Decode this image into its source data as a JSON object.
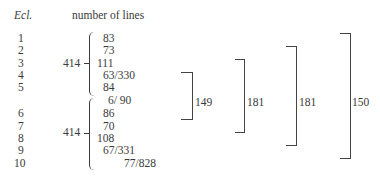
{
  "header": {
    "ecl_label": "Ecl.",
    "lines_label": "number of lines"
  },
  "eclogues": [
    "1",
    "2",
    "3",
    "4",
    "5",
    "6",
    "7",
    "8",
    "9",
    "10"
  ],
  "group1": {
    "total": "414",
    "values": [
      "83",
      "73",
      "111",
      "63/330",
      "84"
    ]
  },
  "group2": {
    "total": "414",
    "values": [
      "6/ 90",
      "86",
      "70",
      "108",
      "67/331",
      "77/828"
    ]
  },
  "brackets": [
    {
      "label": "149"
    },
    {
      "label": "181"
    },
    {
      "label": "181"
    },
    {
      "label": "150"
    }
  ]
}
